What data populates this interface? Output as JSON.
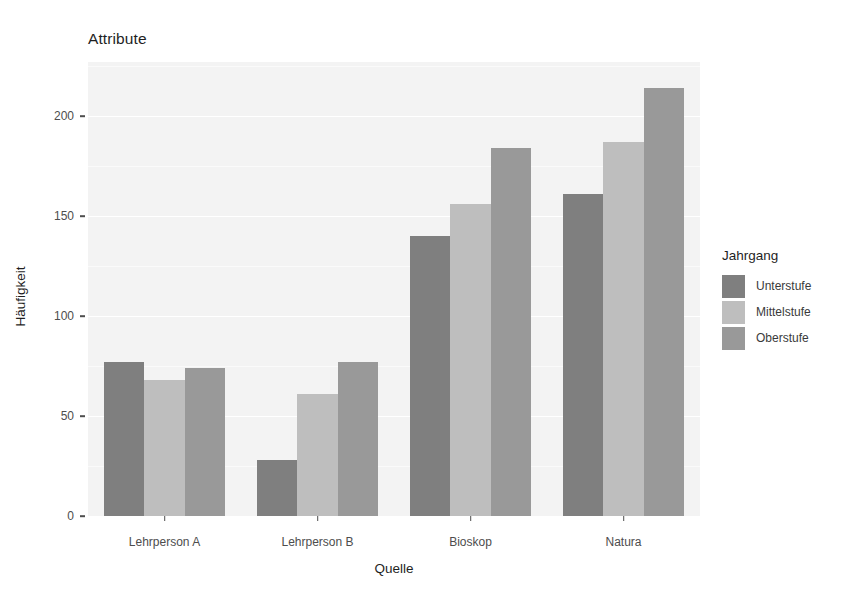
{
  "chart_data": {
    "type": "bar",
    "title": "Attribute",
    "xlabel": "Quelle",
    "ylabel": "Häufigkeit",
    "categories": [
      "Lehrperson A",
      "Lehrperson B",
      "Bioskop",
      "Natura"
    ],
    "series": [
      {
        "name": "Unterstufe",
        "color": "#7f7f7f",
        "values": [
          77,
          28,
          140,
          161
        ]
      },
      {
        "name": "Mittelstufe",
        "color": "#bebebe",
        "values": [
          68,
          61,
          156,
          187
        ]
      },
      {
        "name": "Oberstufe",
        "color": "#999999",
        "values": [
          74,
          77,
          184,
          214
        ]
      }
    ],
    "legend_title": "Jahrgang",
    "legend_position": "right",
    "ylim": [
      0,
      230
    ],
    "yticks": [
      0,
      50,
      100,
      150,
      200
    ],
    "ytick_labels": [
      "0",
      "50",
      "100",
      "150",
      "200"
    ],
    "grid": true,
    "grid_color": "#ffffff",
    "panel_background": "#f3f3f3",
    "bar_grouping": "dodge"
  }
}
